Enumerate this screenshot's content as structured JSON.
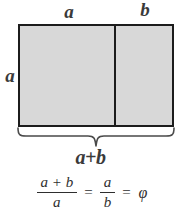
{
  "figure": {
    "title_alt": "Golden ratio rectangle diagram",
    "background_color": "#ffffff",
    "stroke_color": "#1c1c1c",
    "fill_color": "#d8d8d8",
    "text_color": "#2e2e2e"
  },
  "labels": {
    "top_left_segment": "a",
    "top_right_segment": "b",
    "left_side": "a",
    "total_width": "a+b"
  },
  "equation": {
    "fraction1_numerator": "a + b",
    "fraction1_denominator": "a",
    "equals1": "=",
    "fraction2_numerator": "a",
    "fraction2_denominator": "b",
    "equals2": "=",
    "result": "φ"
  },
  "geometry": {
    "rect_left": 18,
    "rect_top": 24,
    "rect_width": 156,
    "rect_height": 103,
    "divider_x": 114,
    "segment_a_width": 96,
    "segment_b_width": 60
  }
}
